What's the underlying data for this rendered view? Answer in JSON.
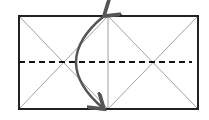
{
  "diagram": {
    "type": "fold-diagram",
    "colors": {
      "background": "#ffffff",
      "outline": "#222222",
      "crease": "#888888",
      "fold_line": "#111111",
      "arrow": "#555555"
    },
    "rectangle": {
      "x": 19,
      "y": 16,
      "width": 179,
      "height": 93
    },
    "divider_x": 108,
    "dashed_line_y": 62,
    "arrow": {
      "label": "fold-arrow",
      "from": [
        108,
        16
      ],
      "apex": [
        67,
        62
      ],
      "to": [
        108,
        109
      ]
    }
  }
}
